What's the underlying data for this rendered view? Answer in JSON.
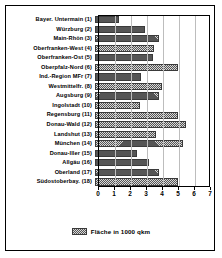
{
  "chart_data": {
    "type": "bar",
    "orientation": "horizontal",
    "title": "",
    "xlabel": "",
    "ylabel": "",
    "xlim": [
      0,
      7
    ],
    "xticks": [
      "0",
      "1",
      "2",
      "3",
      "4",
      "5",
      "6",
      "7"
    ],
    "grid": true,
    "legend_position": "bottom",
    "legend": [
      "Fläche in 1000 qkm"
    ],
    "series_name": "Fläche in 1000 qkm",
    "categories": [
      "Bayer. Untermain (1)",
      "Würzburg (2)",
      "Main-Rhön (3)",
      "Oberfranken-West (4)",
      "Oberfranken-Ost (5)",
      "Oberpfalz-Nord (6)",
      "Ind.-Region MFr (7)",
      "Westmittelfr. (8)",
      "Augsburg (9)",
      "Ingolstadt (10)",
      "Regensburg (11)",
      "Donau-Wald (12)",
      "Landshut (13)",
      "München (14)",
      "Donau-Iller (15)",
      "Allgäu (16)",
      "Oberland (17)",
      "Südostoberbay. (18)"
    ],
    "values": [
      1.5,
      3.1,
      4.0,
      3.7,
      3.6,
      5.2,
      2.9,
      4.2,
      4.0,
      2.8,
      5.2,
      5.7,
      3.8,
      5.5,
      2.6,
      3.4,
      4.0,
      5.2
    ],
    "colors": {
      "bar_fill": "#d8d8d8",
      "bar_hatch": "#555555",
      "bar_edge": "#3a3a3a",
      "grid": "#bdbdbd",
      "axis": "#000000",
      "text": "#000000"
    }
  }
}
